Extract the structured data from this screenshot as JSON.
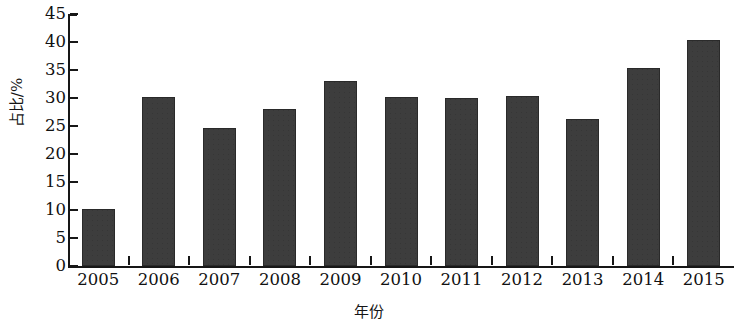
{
  "chart_data": {
    "type": "bar",
    "title": "",
    "xlabel": "年份",
    "ylabel": "占比/%",
    "categories": [
      "2005",
      "2006",
      "2007",
      "2008",
      "2009",
      "2010",
      "2011",
      "2012",
      "2013",
      "2014",
      "2015"
    ],
    "values": [
      10.1,
      30.2,
      24.7,
      28.0,
      33.0,
      30.1,
      30.0,
      30.4,
      26.3,
      35.3,
      40.4
    ],
    "ylim": [
      0,
      45
    ],
    "ytick_labels": [
      "45",
      "40",
      "35",
      "30",
      "25",
      "20",
      "15",
      "10",
      "5",
      "0"
    ],
    "ytick_values": [
      45,
      40,
      35,
      30,
      25,
      20,
      15,
      10,
      5,
      0
    ],
    "grid": false,
    "legend": null,
    "bar_color": "#3d3d3d",
    "bar_edge_color": "#2a2a2a",
    "axis_color": "#171717",
    "background_color": "#ffffff"
  }
}
